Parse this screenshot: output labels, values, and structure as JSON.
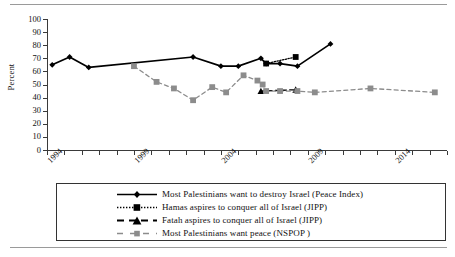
{
  "chart_data": {
    "type": "line",
    "title": "",
    "xlabel": "",
    "ylabel": "Percent",
    "ylim": [
      0,
      100
    ],
    "yticks": [
      0,
      10,
      20,
      30,
      40,
      50,
      60,
      70,
      80,
      90,
      100
    ],
    "xlim": [
      1994,
      2017
    ],
    "xticks": [
      1994,
      1995,
      1996,
      1997,
      1998,
      1999,
      2000,
      2001,
      2002,
      2003,
      2004,
      2005,
      2006,
      2007,
      2008,
      2009,
      2010,
      2011,
      2012,
      2013,
      2014,
      2015,
      2016,
      2017
    ],
    "xtick_labels": [
      "1994",
      "1999",
      "2004",
      "2009",
      "2014"
    ],
    "xtick_labels_years": [
      1994,
      1999,
      2004,
      2009,
      2014
    ],
    "grid": false,
    "legend_position": "below-axes",
    "series": [
      {
        "name": "Most Palestinians want to destroy Israel (Peace Index)",
        "short": "peace-index",
        "color": "#000000",
        "line_style": "solid",
        "marker": "diamond",
        "points": [
          {
            "x": 1994.3,
            "y": 65
          },
          {
            "x": 1995.3,
            "y": 71
          },
          {
            "x": 1996.4,
            "y": 63
          },
          {
            "x": 2002.4,
            "y": 71
          },
          {
            "x": 2004.0,
            "y": 64
          },
          {
            "x": 2005.0,
            "y": 64
          },
          {
            "x": 2006.3,
            "y": 70
          },
          {
            "x": 2006.6,
            "y": 66
          },
          {
            "x": 2007.4,
            "y": 66
          },
          {
            "x": 2008.4,
            "y": 64
          },
          {
            "x": 2010.3,
            "y": 81
          }
        ]
      },
      {
        "name": "Hamas aspires to conquer all of Israel (JIPP)",
        "short": "hamas-jipp",
        "color": "#000000",
        "line_style": "dotted",
        "marker": "square",
        "points": [
          {
            "x": 2006.6,
            "y": 66
          },
          {
            "x": 2008.3,
            "y": 71
          }
        ]
      },
      {
        "name": "Fatah aspires to conquer all of Israel (JIPP)",
        "short": "fatah-jipp",
        "color": "#000000",
        "line_style": "dashed",
        "marker": "triangle",
        "points": [
          {
            "x": 2006.3,
            "y": 45
          },
          {
            "x": 2008.3,
            "y": 46
          }
        ]
      },
      {
        "name": "Most Palestinians want peace (NSPOP )",
        "short": "nspop",
        "color": "#8c8c8c",
        "line_style": "dashed",
        "marker": "square",
        "points": [
          {
            "x": 1999.0,
            "y": 64
          },
          {
            "x": 2000.3,
            "y": 52
          },
          {
            "x": 2001.3,
            "y": 47
          },
          {
            "x": 2002.4,
            "y": 38
          },
          {
            "x": 2003.5,
            "y": 48
          },
          {
            "x": 2004.3,
            "y": 44
          },
          {
            "x": 2005.3,
            "y": 57
          },
          {
            "x": 2006.1,
            "y": 53
          },
          {
            "x": 2006.4,
            "y": 50
          },
          {
            "x": 2006.6,
            "y": 45
          },
          {
            "x": 2007.4,
            "y": 45
          },
          {
            "x": 2008.4,
            "y": 45
          },
          {
            "x": 2009.4,
            "y": 44
          },
          {
            "x": 2012.6,
            "y": 47
          },
          {
            "x": 2016.3,
            "y": 44
          }
        ]
      }
    ]
  },
  "axis": {
    "ylabel": "Percent",
    "ytick_labels": [
      "100",
      "90",
      "80",
      "70",
      "60",
      "50",
      "40",
      "30",
      "20",
      "10",
      "0"
    ],
    "xtick_labels": [
      "1994",
      "1999",
      "2004",
      "2009",
      "2014"
    ]
  },
  "legend": {
    "items": [
      {
        "label": "Most Palestinians want to destroy Israel (Peace Index)",
        "style": "solid-diamond"
      },
      {
        "label": "Hamas aspires to conquer all of Israel (JIPP)",
        "style": "dotted-square"
      },
      {
        "label": "Fatah aspires to conquer all of Israel (JIPP)",
        "style": "dashed-triangle"
      },
      {
        "label": "Most Palestinians want peace (NSPOP )",
        "style": "gray-dashed-square"
      }
    ]
  },
  "colors": {
    "series_black": "#000000",
    "series_gray": "#8c8c8c",
    "axis": "#3a3a3a",
    "rule": "#9a9a9a",
    "background": "#ffffff"
  }
}
